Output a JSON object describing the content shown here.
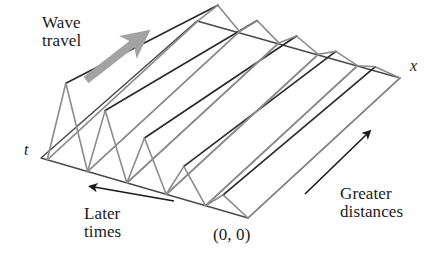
{
  "figure": {
    "background_color": "#ffffff",
    "width": 439,
    "height": 273,
    "colors": {
      "surface_line": "#8c8c8c",
      "crest_line": "#2b2b2b",
      "base_line": "#4a4a4a",
      "thin_arrow": "#1a1a1a",
      "thick_arrow": "#a3a3a3",
      "text": "#1a1a1a"
    }
  },
  "labels": {
    "wave_travel": "Wave\ntravel",
    "later_times": "Later\ntimes",
    "greater_distances": "Greater\ndistances",
    "origin": "(0, 0)",
    "axis_x": "x",
    "axis_t": "t"
  },
  "arrows": {
    "wave_travel": {
      "name": "wave-travel-arrow",
      "style": "thick-gray",
      "from": [
        86,
        80
      ],
      "to": [
        136,
        41
      ],
      "color": "#a3a3a3",
      "width": 8,
      "head_size": 13
    },
    "later_times": {
      "name": "later-times-arrow",
      "style": "thin-black",
      "from": [
        174,
        201
      ],
      "to": [
        94,
        187
      ],
      "color": "#1a1a1a",
      "width": 1.6,
      "head_size": 9
    },
    "greater_distances": {
      "name": "greater-distances-arrow",
      "style": "thin-black",
      "from": [
        305,
        194
      ],
      "to": [
        367,
        134
      ],
      "color": "#1a1a1a",
      "width": 1.6,
      "head_size": 9
    }
  },
  "geometry": {
    "note": "Parallelogram base in oblique projection. Origin is the front/bottom corner; +x runs to the upper right, +t runs to the upper left.",
    "origin": [
      248,
      218
    ],
    "corner_x_end": [
      400,
      78
    ],
    "corner_t_end": [
      41,
      158
    ],
    "corner_far": [
      197,
      21
    ],
    "sawtooth": {
      "cycles": 5,
      "profile": "sawtooth",
      "along_axis": "t",
      "ridge_axis": "x",
      "damping": "amplitude decreases with increasing x",
      "amplitude_at_origin_px": 0,
      "amplitude_at_t_end_px": 86,
      "peak_fractions": [
        0.12,
        0.31,
        0.5,
        0.69,
        0.88
      ],
      "trough_fractions": [
        0.0,
        0.205,
        0.395,
        0.585,
        0.775,
        0.97
      ],
      "peak_amplitudes_px": [
        16,
        33,
        50,
        66,
        82
      ],
      "near_edge_amplitudes_px": [
        4,
        8,
        12,
        16,
        20
      ]
    }
  },
  "chart_data": {
    "type": "line",
    "xlabel": "x",
    "ylabel": "t",
    "series": [
      {
        "name": "crest-1",
        "peak_fraction": 0.12,
        "amplitude_far": 16,
        "amplitude_near": 4
      },
      {
        "name": "crest-2",
        "peak_fraction": 0.31,
        "amplitude_far": 33,
        "amplitude_near": 8
      },
      {
        "name": "crest-3",
        "peak_fraction": 0.5,
        "amplitude_far": 50,
        "amplitude_near": 12
      },
      {
        "name": "crest-4",
        "peak_fraction": 0.69,
        "amplitude_far": 66,
        "amplitude_near": 16
      },
      {
        "name": "crest-5",
        "peak_fraction": 0.88,
        "amplitude_far": 82,
        "amplitude_near": 20
      }
    ],
    "annotations": [
      "Wave travel",
      "Later times",
      "Greater distances",
      "(0, 0)"
    ]
  }
}
